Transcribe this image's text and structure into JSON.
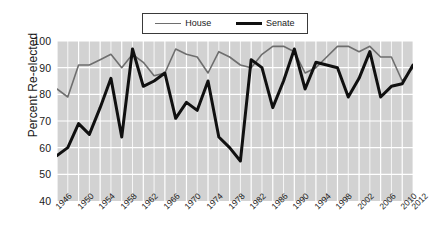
{
  "chart_data": {
    "type": "line",
    "title": "",
    "xlabel": "",
    "ylabel": "Percent Re-elected",
    "xlim": [
      1946,
      2012
    ],
    "ylim": [
      40,
      100
    ],
    "yticks": [
      40,
      50,
      60,
      70,
      80,
      90,
      100
    ],
    "xticks": [
      1946,
      1950,
      1954,
      1958,
      1962,
      1966,
      1970,
      1974,
      1978,
      1982,
      1986,
      1990,
      1994,
      1998,
      2002,
      2006,
      2010,
      2012
    ],
    "grid": true,
    "grid_color": "#ffffff",
    "panel_background": "#d2d2d2",
    "legend_position": "top-center",
    "x": [
      1946,
      1948,
      1950,
      1952,
      1954,
      1956,
      1958,
      1960,
      1962,
      1964,
      1966,
      1968,
      1970,
      1972,
      1974,
      1976,
      1978,
      1980,
      1982,
      1984,
      1986,
      1988,
      1990,
      1992,
      1994,
      1996,
      1998,
      2000,
      2002,
      2004,
      2006,
      2008,
      2010,
      2012
    ],
    "series": [
      {
        "name": "House",
        "color": "#6e6e6e",
        "width": 1.6,
        "values": [
          82,
          79,
          91,
          91,
          93,
          95,
          90,
          95,
          92,
          87,
          88,
          97,
          95,
          94,
          88,
          96,
          94,
          91,
          90,
          95,
          98,
          98,
          96,
          88,
          90,
          94,
          98,
          98,
          96,
          98,
          94,
          94,
          85,
          90
        ]
      },
      {
        "name": "Senate",
        "color": "#101010",
        "width": 3.0,
        "values": [
          57,
          60,
          69,
          65,
          75,
          86,
          64,
          97,
          83,
          85,
          88,
          71,
          77,
          74,
          85,
          64,
          60,
          55,
          93,
          90,
          75,
          85,
          97,
          82,
          92,
          91,
          90,
          79,
          86,
          96,
          79,
          83,
          84,
          91
        ]
      }
    ]
  },
  "legend": {
    "items": [
      {
        "label": "House",
        "style": "house"
      },
      {
        "label": "Senate",
        "style": "senate"
      }
    ]
  },
  "axes": {
    "y_title": "Percent Re-elected"
  }
}
